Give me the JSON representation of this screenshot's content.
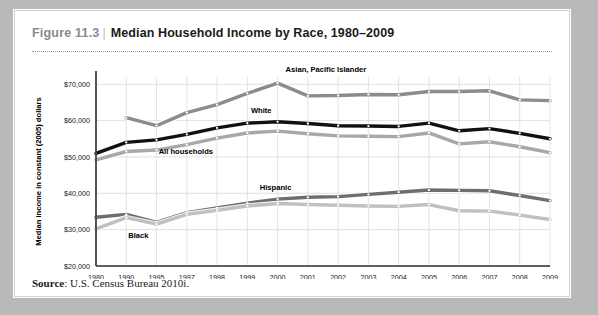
{
  "figure": {
    "number": "Figure 11.3",
    "separator": "|",
    "title": "Median Household Income by Race, 1980–2009",
    "source_label": "Source",
    "source_text": ": U.S. Census Bureau 2010i."
  },
  "chart_data": {
    "type": "line",
    "title": "Median Household Income by Race, 1980–2009",
    "xlabel": "",
    "ylabel": "Median income in constant (2005) dollars",
    "categories": [
      "1980",
      "1990",
      "1995",
      "1997",
      "1998",
      "1999",
      "2000",
      "2001",
      "2002",
      "2003",
      "2004",
      "2005",
      "2006",
      "2007",
      "2008",
      "2009"
    ],
    "ylim": [
      20000,
      72000
    ],
    "yticks": [
      20000,
      30000,
      40000,
      50000,
      60000,
      70000
    ],
    "ytick_labels": [
      "$20,000",
      "$30,000",
      "$40,000",
      "$50,000",
      "$60,000",
      "$70,000"
    ],
    "grid": true,
    "legend": "inline-labels",
    "series": [
      {
        "name": "Asian, Pacific Islander",
        "color": "#8c8c8c",
        "label_x": "2000",
        "values": [
          null,
          60800,
          58600,
          62200,
          64400,
          67500,
          70300,
          66800,
          66900,
          67200,
          67100,
          68000,
          68000,
          68200,
          65700,
          65500
        ]
      },
      {
        "name": "White",
        "color": "#111111",
        "label_x": "2000",
        "values": [
          51000,
          54000,
          54700,
          56200,
          58000,
          59300,
          59700,
          59200,
          58600,
          58500,
          58400,
          59300,
          57200,
          57800,
          56500,
          55000
        ]
      },
      {
        "name": "All households",
        "color": "#a8a8a8",
        "label_x": "1998",
        "values": [
          49200,
          51500,
          51900,
          53400,
          55200,
          56600,
          57100,
          56400,
          55800,
          55700,
          55600,
          56600,
          53600,
          54200,
          52800,
          51200
        ]
      },
      {
        "name": "Hispanic",
        "color": "#6e6e6e",
        "label_x": "2000",
        "values": [
          33400,
          34200,
          32000,
          34700,
          36000,
          37300,
          38400,
          38900,
          39100,
          39700,
          40300,
          40900,
          40800,
          40700,
          39400,
          38000
        ]
      },
      {
        "name": "Black",
        "color": "#c0c0c0",
        "label_x": "1990",
        "values": [
          30200,
          33300,
          31500,
          34200,
          35300,
          36500,
          37200,
          36900,
          36700,
          36500,
          36400,
          36900,
          35200,
          35100,
          34000,
          32800
        ]
      }
    ]
  }
}
